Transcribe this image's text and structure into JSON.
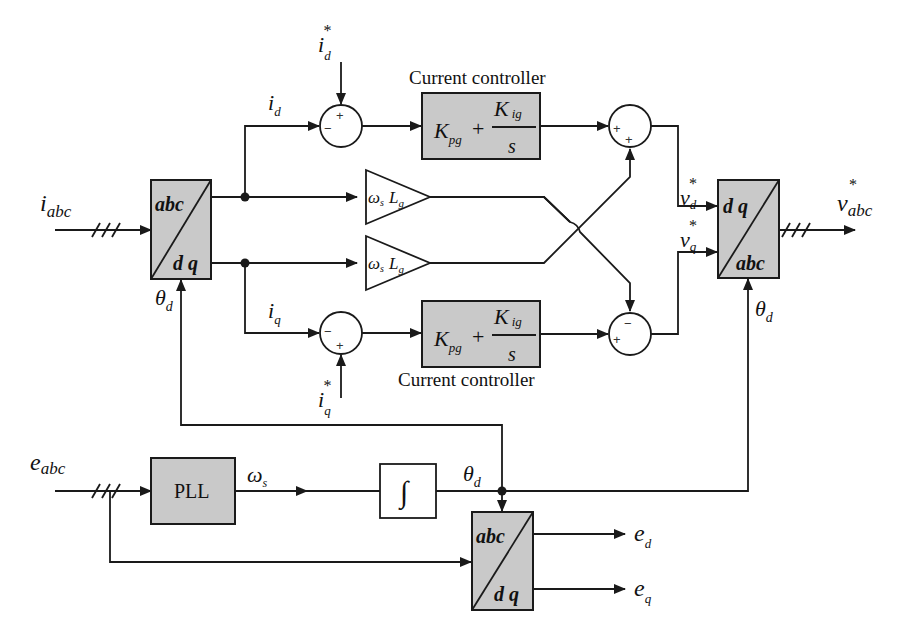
{
  "diagram": {
    "type": "control-block-diagram",
    "colors": {
      "block_fill": "#c9c9c9",
      "line": "#1a1a1a",
      "background": "#ffffff"
    },
    "inputs": {
      "i_abc": {
        "base": "i",
        "sub": "abc"
      },
      "e_abc": {
        "base": "e",
        "sub": "abc"
      },
      "id_ref": {
        "base": "i",
        "sub": "d",
        "sup": "*"
      },
      "iq_ref": {
        "base": "i",
        "sub": "q",
        "sup": "*"
      }
    },
    "outputs": {
      "v_abc_ref": {
        "base": "v",
        "sub": "abc",
        "sup": "*"
      },
      "e_d": {
        "base": "e",
        "sub": "d"
      },
      "e_q": {
        "base": "e",
        "sub": "q"
      }
    },
    "signals": {
      "i_d": {
        "base": "i",
        "sub": "d"
      },
      "i_q": {
        "base": "i",
        "sub": "q"
      },
      "vd_ref": {
        "base": "v",
        "sub": "d",
        "sup": "*"
      },
      "vq_ref": {
        "base": "v",
        "sub": "q",
        "sup": "*"
      },
      "theta_d": {
        "base": "θ",
        "sub": "d"
      },
      "omega_s": {
        "base": "ω",
        "sub": "s"
      }
    },
    "blocks": {
      "abc_dq_current": {
        "top": "abc",
        "bottom": "d q"
      },
      "dq_abc_voltage": {
        "top": "d q",
        "bottom": "abc"
      },
      "abc_dq_grid": {
        "top": "abc",
        "bottom": "d q"
      },
      "pll": {
        "label": "PLL"
      },
      "integrator": {
        "label": "∫"
      },
      "controller_d": {
        "caption": "Current controller",
        "kp": "K",
        "kp_sub": "pg",
        "plus": "+",
        "ki": "K",
        "ki_sub": "ig",
        "den": "s"
      },
      "controller_q": {
        "caption": "Current controller",
        "kp": "K",
        "kp_sub": "pg",
        "plus": "+",
        "ki": "K",
        "ki_sub": "ig",
        "den": "s"
      },
      "gain_top": {
        "omega": "ω",
        "omega_sub": "s",
        "L": "L",
        "L_sub": "g"
      },
      "gain_bottom": {
        "omega": "ω",
        "omega_sub": "s",
        "L": "L",
        "L_sub": "g"
      }
    },
    "summers": {
      "sum_d_error": {
        "signs": [
          "+",
          "−"
        ]
      },
      "sum_q_error": {
        "signs": [
          "−",
          "+"
        ]
      },
      "sum_d_out": {
        "signs": [
          "+",
          "+"
        ]
      },
      "sum_q_out": {
        "signs": [
          "−",
          "+"
        ]
      }
    }
  }
}
